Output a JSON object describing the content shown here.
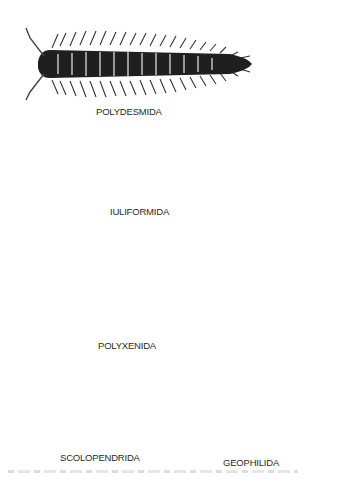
{
  "figure": {
    "labels": {
      "polydesmida": "POLYDESMIDA",
      "iuliformida": "IULIFORMIDA",
      "polyxenida": "POLYXENIDA",
      "scolopendrida": "SCOLOPENDRIDA",
      "geophilida": "GEOPHILIDA"
    },
    "colors": {
      "ink": "#1e1e1e",
      "background": "#ffffff",
      "shade": "#888888"
    }
  }
}
